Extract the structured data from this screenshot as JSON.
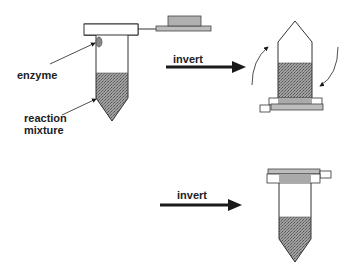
{
  "diagram": {
    "labels": {
      "enzyme": "enzyme",
      "reaction_line1": "reaction",
      "reaction_line2": "mixture"
    },
    "arrows": [
      {
        "label": "invert"
      },
      {
        "label": "invert"
      }
    ],
    "steps": [
      {
        "name": "open tube with enzyme drop on wall above reaction mixture",
        "cap": "open"
      },
      {
        "name": "tube inverted with rotation arrows",
        "orientation": "upside-down"
      },
      {
        "name": "tube upright after second inversion",
        "cap": "closed"
      }
    ],
    "colors": {
      "outline": "#333333",
      "fill_pattern": "#8a8a8a",
      "cap_gray": "#b8b8b8",
      "arrow": "#1a1a1a"
    }
  }
}
